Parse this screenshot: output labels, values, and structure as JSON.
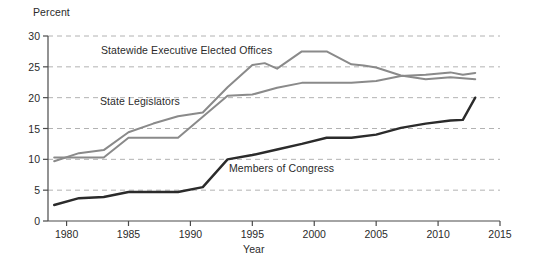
{
  "chart_data": {
    "type": "line",
    "title": "",
    "xlabel": "Year",
    "ylabel": "Percent",
    "xlim": [
      1978.5,
      2015
    ],
    "ylim": [
      0,
      30
    ],
    "grid": true,
    "grid_style": "dashed-horizontal",
    "legend_position": "inline-annotations",
    "xticks": [
      1980,
      1985,
      1990,
      1995,
      2000,
      2005,
      2010,
      2015
    ],
    "xticklabels": [
      "1980",
      "1985",
      "1990",
      "1995",
      "2000",
      "2005",
      "2010",
      "2015"
    ],
    "yticks": [
      0,
      5,
      10,
      15,
      20,
      25,
      30
    ],
    "yticklabels": [
      "0",
      "5",
      "10",
      "15",
      "20",
      "25",
      "30"
    ],
    "series": [
      {
        "name": "Statewide Executive Elected Offices",
        "color": "#8a8a8a",
        "width": 2.0,
        "label_x": 101,
        "label_y": 44,
        "x": [
          1979,
          1981,
          1983,
          1985,
          1987,
          1989,
          1991,
          1993,
          1995,
          1996,
          1997,
          1999,
          2001,
          2003,
          2004,
          2005,
          2007,
          2009,
          2011,
          2013
        ],
        "y": [
          9.7,
          11.0,
          11.5,
          14.4,
          15.8,
          17.0,
          17.6,
          21.7,
          25.3,
          25.6,
          24.7,
          27.5,
          27.5,
          25.4,
          25.2,
          24.9,
          23.6,
          23.0,
          23.3,
          23.0
        ]
      },
      {
        "name": "State Legislators",
        "color": "#8a8a8a",
        "width": 2.0,
        "label_x": 100,
        "label_y": 95,
        "x": [
          1979,
          1981,
          1983,
          1985,
          1987,
          1989,
          1991,
          1993,
          1995,
          1997,
          1999,
          2001,
          2003,
          2005,
          2007,
          2009,
          2011,
          2012,
          2013
        ],
        "y": [
          10.3,
          10.3,
          10.3,
          13.5,
          13.5,
          13.5,
          16.9,
          20.3,
          20.5,
          21.6,
          22.4,
          22.4,
          22.4,
          22.7,
          23.5,
          23.7,
          24.1,
          23.7,
          24.0
        ]
      },
      {
        "name": "Members of Congress",
        "color": "#2b2b2b",
        "width": 2.4,
        "label_x": 229,
        "label_y": 162,
        "x": [
          1979,
          1981,
          1983,
          1985,
          1987,
          1989,
          1991,
          1993,
          1995,
          1997,
          1999,
          2001,
          2003,
          2005,
          2007,
          2009,
          2011,
          2012,
          2013
        ],
        "y": [
          2.6,
          3.7,
          3.9,
          4.7,
          4.7,
          4.7,
          5.5,
          10.0,
          10.7,
          11.6,
          12.5,
          13.5,
          13.5,
          14.0,
          15.1,
          15.8,
          16.3,
          16.4,
          20.0
        ]
      }
    ]
  },
  "axes": {
    "percent_label": "Percent",
    "year_label": "Year"
  }
}
